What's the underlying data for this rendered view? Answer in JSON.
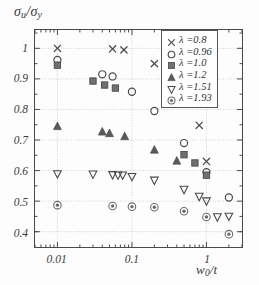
{
  "chart_data": {
    "type": "scatter",
    "title": "",
    "xlabel": "w₀/t",
    "ylabel": "σu/σy",
    "xscale": "log",
    "yscale": "linear",
    "xlim": [
      0.005,
      3.0
    ],
    "ylim": [
      0.35,
      1.06
    ],
    "grid": true,
    "legend_position": "top-right",
    "xticks": [
      "0.01",
      "0.1",
      "1"
    ],
    "xtick_values": [
      0.01,
      0.1,
      1
    ],
    "yticks": [
      "1",
      "0.9",
      "0.8",
      "0.7",
      "0.6",
      "0.5",
      "0.4"
    ],
    "ytick_values": [
      1,
      0.9,
      0.8,
      0.7,
      0.6,
      0.5,
      0.4
    ],
    "series": [
      {
        "name": "λ =0.8",
        "lambda": 0.8,
        "marker": "cross",
        "color": "#4a4a4a",
        "points": [
          {
            "x": 0.01,
            "y": 1.0
          },
          {
            "x": 0.055,
            "y": 0.998
          },
          {
            "x": 0.078,
            "y": 0.995
          },
          {
            "x": 0.2,
            "y": 0.95
          },
          {
            "x": 0.5,
            "y": 0.877
          },
          {
            "x": 0.8,
            "y": 0.748
          },
          {
            "x": 1.0,
            "y": 0.63
          }
        ]
      },
      {
        "name": "λ =0.96",
        "lambda": 0.96,
        "marker": "circle-open",
        "color": "#4a4a4a",
        "points": [
          {
            "x": 0.01,
            "y": 0.962
          },
          {
            "x": 0.04,
            "y": 0.915
          },
          {
            "x": 0.055,
            "y": 0.908
          },
          {
            "x": 0.1,
            "y": 0.858
          },
          {
            "x": 0.2,
            "y": 0.795
          },
          {
            "x": 0.5,
            "y": 0.69
          },
          {
            "x": 1.0,
            "y": 0.595
          },
          {
            "x": 2.0,
            "y": 0.512
          }
        ]
      },
      {
        "name": "λ =1.0",
        "lambda": 1.0,
        "marker": "square-filled",
        "color": "#707070",
        "points": [
          {
            "x": 0.01,
            "y": 0.945
          },
          {
            "x": 0.03,
            "y": 0.893
          },
          {
            "x": 0.043,
            "y": 0.88
          },
          {
            "x": 0.06,
            "y": 0.87
          },
          {
            "x": 0.5,
            "y": 0.652
          },
          {
            "x": 0.7,
            "y": 0.625
          },
          {
            "x": 1.0,
            "y": 0.585
          }
        ]
      },
      {
        "name": "λ =1.2",
        "lambda": 1.2,
        "marker": "triangle-up-filled",
        "color": "#5a5a5a",
        "points": [
          {
            "x": 0.01,
            "y": 0.745
          },
          {
            "x": 0.04,
            "y": 0.727
          },
          {
            "x": 0.05,
            "y": 0.722
          },
          {
            "x": 0.08,
            "y": 0.712
          },
          {
            "x": 0.2,
            "y": 0.668
          },
          {
            "x": 0.4,
            "y": 0.632
          }
        ]
      },
      {
        "name": "λ =1.51",
        "lambda": 1.51,
        "marker": "triangle-down-open",
        "color": "#4a4a4a",
        "points": [
          {
            "x": 0.01,
            "y": 0.589
          },
          {
            "x": 0.03,
            "y": 0.588
          },
          {
            "x": 0.055,
            "y": 0.586
          },
          {
            "x": 0.065,
            "y": 0.585
          },
          {
            "x": 0.075,
            "y": 0.585
          },
          {
            "x": 0.1,
            "y": 0.58
          },
          {
            "x": 0.2,
            "y": 0.568
          },
          {
            "x": 0.5,
            "y": 0.538
          },
          {
            "x": 0.8,
            "y": 0.515
          },
          {
            "x": 1.0,
            "y": 0.5
          },
          {
            "x": 1.4,
            "y": 0.448
          },
          {
            "x": 2.0,
            "y": 0.45
          }
        ]
      },
      {
        "name": "λ =1.93",
        "lambda": 1.93,
        "marker": "circle-target",
        "color": "#6a6a6a",
        "points": [
          {
            "x": 0.01,
            "y": 0.487
          },
          {
            "x": 0.055,
            "y": 0.484
          },
          {
            "x": 0.1,
            "y": 0.482
          },
          {
            "x": 0.2,
            "y": 0.48
          },
          {
            "x": 0.5,
            "y": 0.467
          },
          {
            "x": 1.0,
            "y": 0.448
          },
          {
            "x": 2.0,
            "y": 0.392
          }
        ]
      }
    ]
  },
  "axes": {
    "ylabel_sigma": "σ",
    "ylabel_u": "u",
    "ylabel_slash": "/",
    "ylabel_sigma2": "σ",
    "ylabel_y": "y",
    "xlabel_w": "w",
    "xlabel_0": "0",
    "xlabel_t": "/t"
  }
}
